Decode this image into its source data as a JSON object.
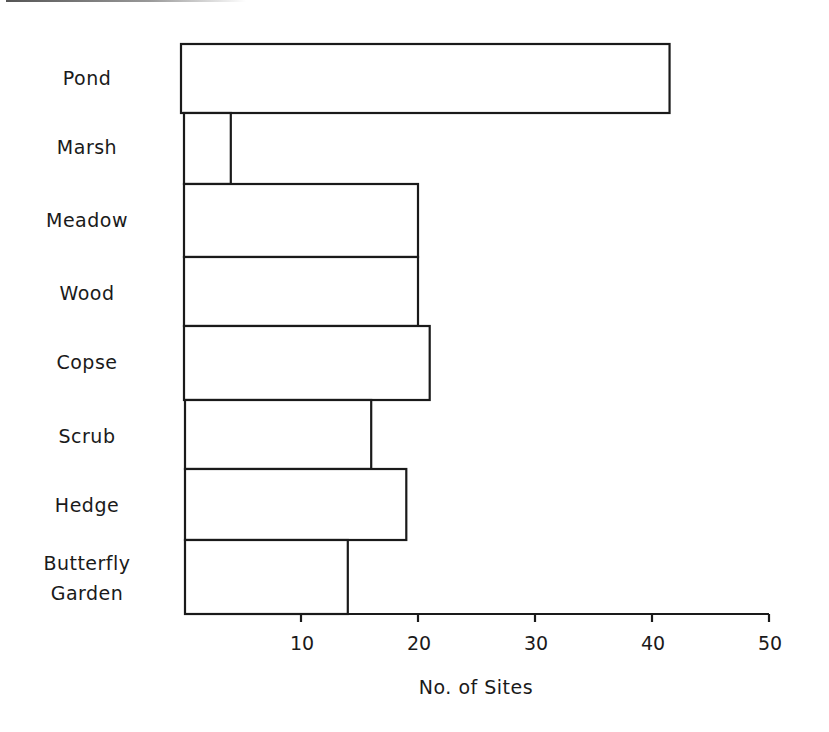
{
  "chart_data": {
    "type": "bar",
    "orientation": "horizontal",
    "title": "",
    "xlabel": "No. of Sites",
    "ylabel": "",
    "categories": [
      "Pond",
      "Marsh",
      "Meadow",
      "Wood",
      "Copse",
      "Scrub",
      "Hedge",
      "Butterfly Garden"
    ],
    "values": [
      41.5,
      4,
      20,
      20,
      21,
      16,
      19,
      14
    ],
    "xlim": [
      0,
      50
    ],
    "xticks": [
      10,
      20,
      30,
      40,
      50
    ],
    "grid": false,
    "legend": null
  },
  "labels": {
    "categories": [
      "Pond",
      "Marsh",
      "Meadow",
      "Wood",
      "Copse",
      "Scrub",
      "Hedge",
      "Butterfly",
      "Garden"
    ],
    "ticks": [
      "10",
      "20",
      "30",
      "40",
      "50"
    ],
    "xlabel": "No. of Sites"
  },
  "colors": {
    "stroke": "#1a1a1a",
    "fill": "#ffffff"
  }
}
